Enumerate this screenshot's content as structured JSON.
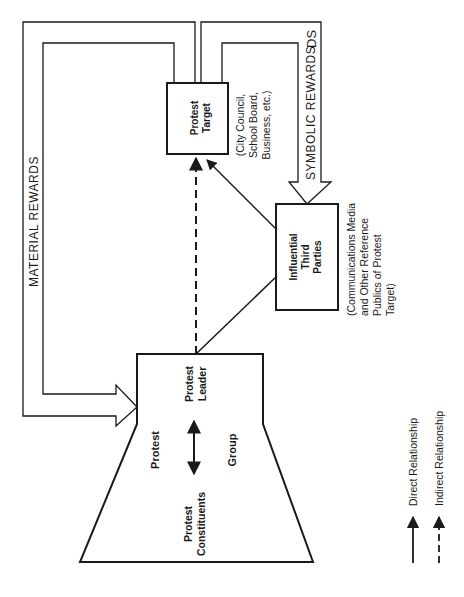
{
  "diagram": {
    "orientation": "rotated-90-ccw",
    "nodes": {
      "protest_target": {
        "line1": "Protest",
        "line2": "Target"
      },
      "protest_target_note": {
        "line1": "(City Council,",
        "line2": "School Board,",
        "line3": "Business, etc.)"
      },
      "influential_third_parties": {
        "line1": "Influential",
        "line2": "Third",
        "line3": "Parties"
      },
      "third_parties_note": {
        "line1": "(Communications Media",
        "line2": "and Other Reference",
        "line3": "Publics of Protest",
        "line4": "Target)"
      },
      "protest_group": {
        "protest_label": "Protest",
        "group_label": "Group",
        "leader": {
          "line1": "Protest",
          "line2": "Leader"
        },
        "constituents": {
          "line1": "Protest",
          "line2": "Constituents"
        }
      }
    },
    "flows": {
      "material_rewards": "MATERIAL REWARDS",
      "symbolic_rewards": "SYMBOLIC REWARDS",
      "ds_mark": "DS"
    },
    "legend": {
      "direct": "Direct Relationship",
      "indirect": "Indirect Relationship"
    },
    "colors": {
      "ink": "#1a1a1a",
      "background": "#ffffff"
    }
  }
}
